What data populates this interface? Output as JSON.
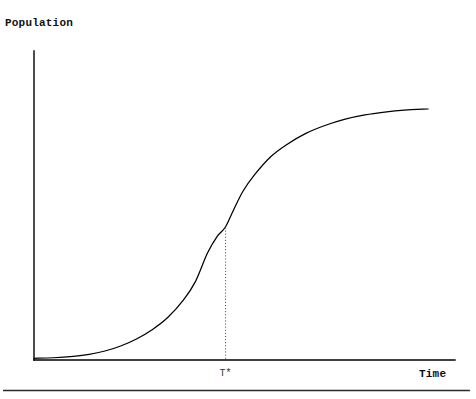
{
  "figure": {
    "background_color": "#ffffff",
    "ink_color": "#000000"
  },
  "labels": {
    "y_axis_title": "Population",
    "x_axis_title": "Time",
    "inflection_tick": "T*"
  },
  "chart_data": {
    "type": "line",
    "title": "",
    "subtitle": "",
    "xlabel": "Time",
    "ylabel": "Population",
    "grid": false,
    "legend": null,
    "legend_position": "none",
    "xlim": [
      0,
      1
    ],
    "ylim": [
      0,
      1
    ],
    "x_ticks": [
      "T*"
    ],
    "x_tick_values": [
      0.485
    ],
    "y_ticks": [],
    "annotations": [
      {
        "name": "inflection-marker",
        "label": "T*",
        "style": "dotted-vertical",
        "x": 0.485,
        "y_from": 0.0,
        "y_to": 0.472
      }
    ],
    "series": [
      {
        "name": "logistic-growth",
        "color": "#000000",
        "style": "solid",
        "x": [
          0.0,
          0.05,
          0.1,
          0.14,
          0.18,
          0.22,
          0.26,
          0.3,
          0.34,
          0.38,
          0.41,
          0.44,
          0.465,
          0.485,
          0.505,
          0.53,
          0.56,
          0.6,
          0.64,
          0.69,
          0.74,
          0.79,
          0.84,
          0.89,
          0.94,
          1.0
        ],
        "y": [
          0.006,
          0.008,
          0.013,
          0.02,
          0.032,
          0.05,
          0.075,
          0.108,
          0.152,
          0.215,
          0.28,
          0.38,
          0.44,
          0.472,
          0.53,
          0.6,
          0.66,
          0.723,
          0.766,
          0.807,
          0.836,
          0.858,
          0.873,
          0.883,
          0.89,
          0.894
        ]
      }
    ]
  },
  "geometry": {
    "y_axis_x": 34,
    "y_axis_top": 51,
    "x_axis_y": 360,
    "x_axis_right": 455,
    "marker_x": 238,
    "marker_top": 214,
    "curve_end_x": 428,
    "curve_end_y": 109,
    "footer_rule_y": 390
  }
}
